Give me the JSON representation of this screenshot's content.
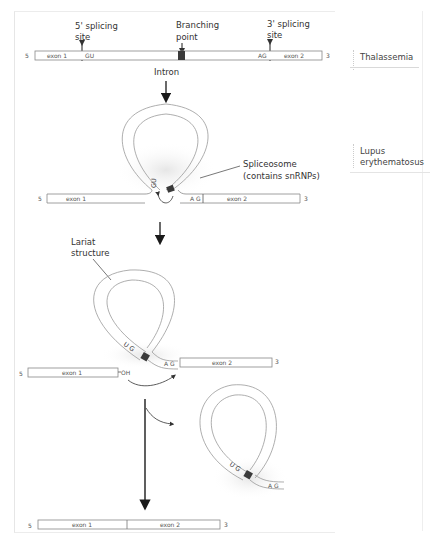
{
  "diagram": {
    "stage1": {
      "labels": {
        "five_prime_site": [
          "5' splicing",
          "site"
        ],
        "branch_point": [
          "Branching",
          "point"
        ],
        "three_prime_site": [
          "3' splicing",
          "site"
        ],
        "intron": "Intron"
      },
      "strand": {
        "five_end": "5",
        "three_end": "3",
        "exon1": "exon 1",
        "exon2": "exon 2",
        "gu": "GU",
        "ag": "AG"
      }
    },
    "stage2": {
      "spliceosome_label": [
        "Spliceosome",
        "(contains snRNPs)"
      ],
      "strand": {
        "five_end": "5",
        "three_end": "3",
        "exon1": "exon 1",
        "exon2": "exon 2",
        "gu": "GU",
        "ag": "A G"
      }
    },
    "stage3": {
      "lariat_label": [
        "Lariat",
        "structure"
      ],
      "strand": {
        "five_end": "5",
        "three_end": "3",
        "exon1": "exon 1",
        "exon2": "exon 2",
        "oh": "OH",
        "ug": "U G",
        "ag": "A G"
      }
    },
    "stage4": {
      "released_lariat": {
        "ug": "U G",
        "ag": "A G"
      },
      "product": {
        "five_end": "5",
        "three_end": "3",
        "exon1": "exon 1",
        "exon2": "exon 2"
      }
    }
  },
  "sidebar": {
    "items": [
      {
        "label_lines": [
          "Thalassemia"
        ]
      },
      {
        "label_lines": [
          "Lupus",
          "erythematosus"
        ]
      }
    ]
  },
  "colors": {
    "line": "#8a8a8a",
    "arrow": "#1a1a1a",
    "branch_box": "#3a3a3a",
    "shadow": "#ececec"
  }
}
